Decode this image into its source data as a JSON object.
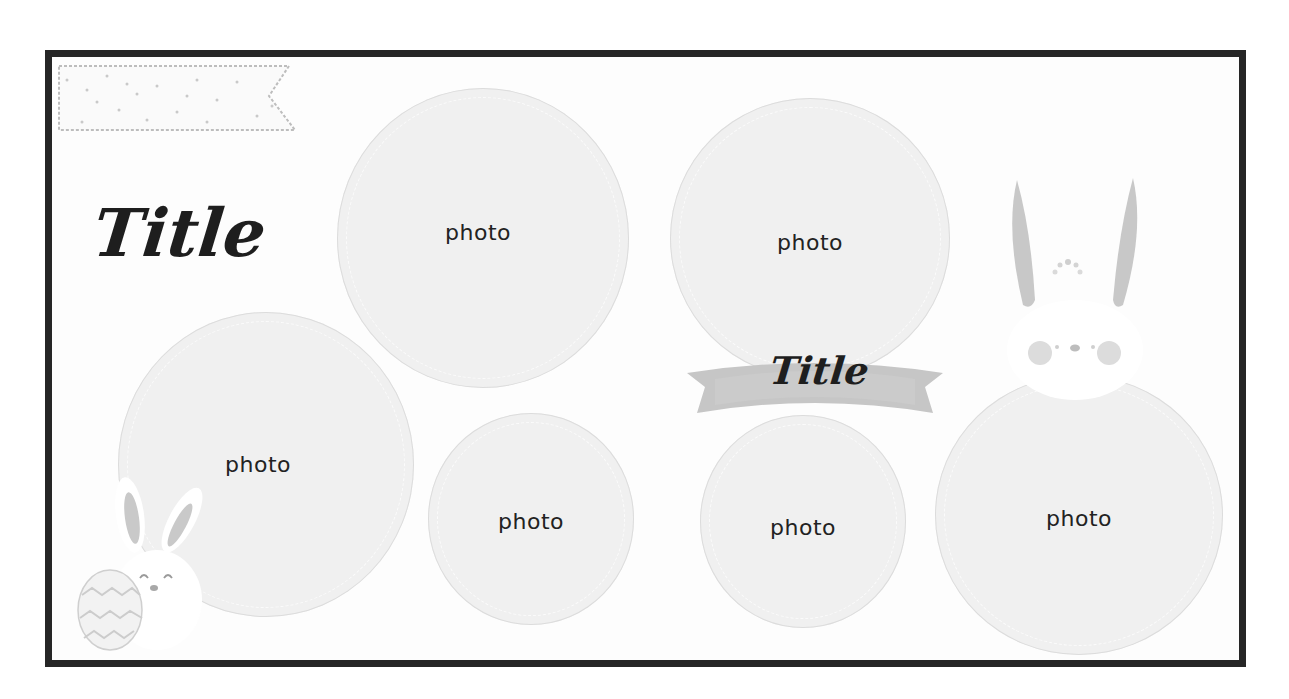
{
  "canvas": {
    "frame_color": "#262626",
    "background": "#fdfdfd",
    "circle_fill": "#f0f0f0",
    "accent_gray": "#c8c8c8"
  },
  "titles": {
    "main": "Title",
    "ribbon": "Title"
  },
  "photos": [
    {
      "label": "photo",
      "name": "photo-top-left"
    },
    {
      "label": "photo",
      "name": "photo-top-right"
    },
    {
      "label": "photo",
      "name": "photo-large-left"
    },
    {
      "label": "photo",
      "name": "photo-bottom-center-left"
    },
    {
      "label": "photo",
      "name": "photo-bottom-center-right"
    },
    {
      "label": "photo",
      "name": "photo-right"
    }
  ],
  "decorations": {
    "banner": "dotted-flag-banner",
    "ribbon": "gray-ribbon-banner",
    "bunny_large": "bunny-peeking",
    "bunny_small": "bunny-with-egg"
  }
}
